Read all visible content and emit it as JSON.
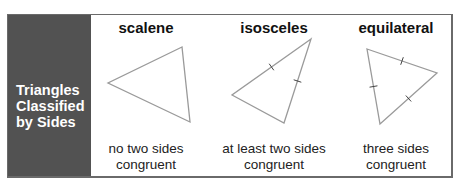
{
  "panel": {
    "title_lines": [
      "Triangles",
      "Classified",
      "by Sides"
    ],
    "background": "#525252",
    "text_color": "#ffffff"
  },
  "columns": [
    {
      "heading": "scalene",
      "caption_lines": [
        "no two sides",
        "congruent"
      ],
      "triangle": {
        "points": [
          [
            182,
            47
          ],
          [
            108,
            83
          ],
          [
            190,
            122
          ]
        ],
        "tick_marks": 0
      }
    },
    {
      "heading": "isosceles",
      "caption_lines": [
        "at least two sides",
        "congruent"
      ],
      "triangle": {
        "points": [
          [
            311,
            39
          ],
          [
            232,
            95
          ],
          [
            284,
            123
          ]
        ],
        "tick_marks": 2
      }
    },
    {
      "heading": "equilateral",
      "caption_lines": [
        "three sides",
        "congruent"
      ],
      "triangle": {
        "points": [
          [
            367,
            49
          ],
          [
            437,
            73
          ],
          [
            380,
            124
          ]
        ],
        "tick_marks": 3
      }
    }
  ],
  "colors": {
    "frame_border": "#6a6a6a",
    "triangle_stroke": "#9a9a9a",
    "tick_stroke": "#444444"
  }
}
